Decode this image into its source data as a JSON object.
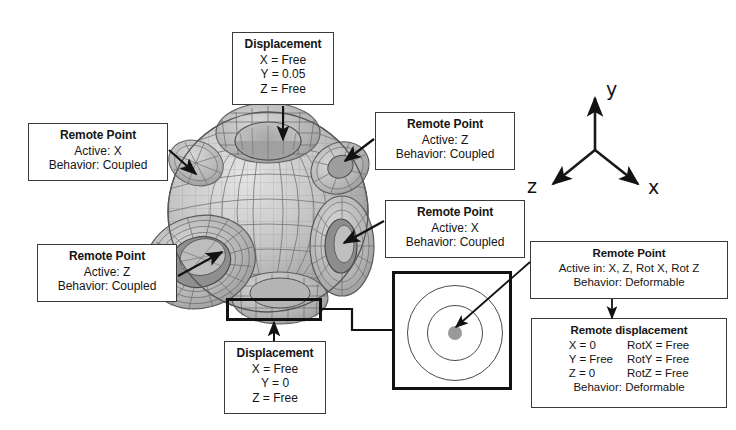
{
  "figure": {
    "type": "fea-boundary-condition-diagram",
    "background": "#ffffff",
    "line_color": "#3a3a3a"
  },
  "axes_triad": {
    "name": "coordinate-triad",
    "origin": [
      595,
      150
    ],
    "labels": {
      "x": "x",
      "y": "y",
      "z": "z"
    }
  },
  "model": {
    "name": "meshed-sphere-with-six-cylindrical-holes",
    "description": "Shaded finite-element mesh of a sphere with six circular through-holes"
  },
  "callouts": [
    {
      "id": "displacement-top",
      "title": "Displacement",
      "lines": [
        "X = Free",
        "Y = 0.05",
        "Z = Free"
      ]
    },
    {
      "id": "remote-point-left-top",
      "title": "Remote Point",
      "lines": [
        "Active: X",
        "Behavior: Coupled"
      ]
    },
    {
      "id": "remote-point-right-top",
      "title": "Remote Point",
      "lines": [
        "Active: Z",
        "Behavior: Coupled"
      ]
    },
    {
      "id": "remote-point-right-mid",
      "title": "Remote Point",
      "lines": [
        "Active: X",
        "Behavior: Coupled"
      ]
    },
    {
      "id": "remote-point-left-bottom",
      "title": "Remote Point",
      "lines": [
        "Active: Z",
        "Behavior: Coupled"
      ]
    },
    {
      "id": "displacement-bottom",
      "title": "Displacement",
      "lines": [
        "X = Free",
        "Y = 0",
        "Z = Free"
      ]
    },
    {
      "id": "remote-point-detail",
      "title": "Remote Point",
      "lines": [
        "Active in: X, Z, Rot X, Rot Z",
        "Behavior: Deformable"
      ]
    },
    {
      "id": "remote-displacement",
      "title": "Remote displacement",
      "col_left": [
        "X = 0",
        "Y = Free",
        "Z = 0"
      ],
      "col_right": [
        "RotX = Free",
        "RotY = Free",
        "RotZ = Free"
      ],
      "footer": "Behavior: Deformable"
    }
  ],
  "detail_view": {
    "name": "detail-zoom-view",
    "rings": 2,
    "hub": "remote-point-hub"
  }
}
